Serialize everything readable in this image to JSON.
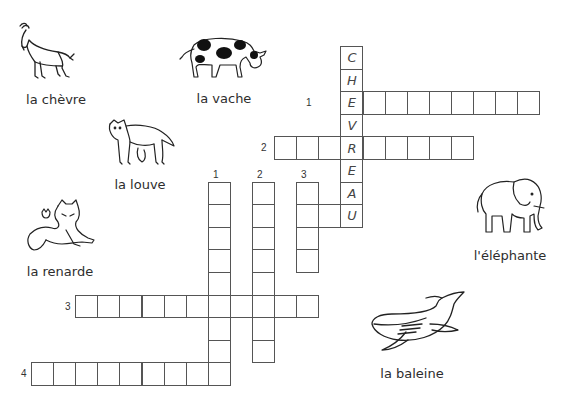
{
  "puzzle": {
    "type": "crossword",
    "language": "fr",
    "grid": {
      "origin_x": 31,
      "origin_y": 46,
      "cell_w": 22.1,
      "cell_h": 22.6
    },
    "solution_word": {
      "letters": [
        "C",
        "H",
        "E",
        "V",
        "R",
        "E",
        "A",
        "U"
      ],
      "col": 14,
      "start_row": 0
    },
    "across": [
      {
        "number": "1",
        "row": 2,
        "col": 14,
        "length": 9,
        "number_pos": {
          "x": 306,
          "y": 97
        }
      },
      {
        "number": "2",
        "row": 4,
        "col": 11,
        "length": 9,
        "number_pos": {
          "x": 261,
          "y": 142
        }
      },
      {
        "number": "3",
        "row": 11,
        "col": 2,
        "length": 11,
        "number_pos": {
          "x": 65,
          "y": 301
        }
      },
      {
        "number": "4",
        "row": 14,
        "col": 0,
        "length": 9,
        "number_pos": {
          "x": 21,
          "y": 368
        }
      }
    ],
    "down": [
      {
        "number": "1",
        "row": 6,
        "col": 8,
        "length": 9,
        "number_pos": {
          "x": 213,
          "y": 169
        }
      },
      {
        "number": "2",
        "row": 6,
        "col": 10,
        "length": 8,
        "number_pos": {
          "x": 257,
          "y": 169
        }
      },
      {
        "number": "3",
        "row": 6,
        "col": 12,
        "length": 4,
        "number_pos": {
          "x": 301,
          "y": 169
        }
      }
    ],
    "extra_cells": [
      {
        "row": 7,
        "col": 13
      }
    ]
  },
  "animals": [
    {
      "id": "goat",
      "label": "la chèvre",
      "label_x": 56,
      "label_y": 92
    },
    {
      "id": "cow",
      "label": "la vache",
      "label_x": 224,
      "label_y": 91
    },
    {
      "id": "wolf",
      "label": "la louve",
      "label_x": 140,
      "label_y": 177
    },
    {
      "id": "fox",
      "label": "la renarde",
      "label_x": 60,
      "label_y": 264
    },
    {
      "id": "elephant",
      "label": "l'éléphante",
      "label_x": 510,
      "label_y": 248
    },
    {
      "id": "whale",
      "label": "la baleine",
      "label_x": 412,
      "label_y": 366
    }
  ]
}
